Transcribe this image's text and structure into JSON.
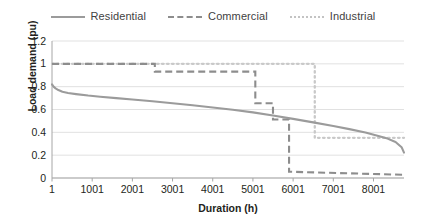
{
  "chart_data": {
    "type": "line",
    "title": "",
    "xlabel": "Duration (h)",
    "ylabel": "Load demand (pu)",
    "xlim": [
      1,
      8760
    ],
    "ylim": [
      0,
      1.2
    ],
    "xticks": [
      1,
      1001,
      2001,
      3001,
      4001,
      5001,
      6001,
      7001,
      8001
    ],
    "xtick_labels": [
      "1",
      "1001",
      "2001",
      "3001",
      "4001",
      "5001",
      "6001",
      "7001",
      "8001"
    ],
    "yticks": [
      0,
      0.2,
      0.4,
      0.6,
      0.8,
      1,
      1.2
    ],
    "ytick_labels": [
      "0",
      "0.2",
      "0.4",
      "0.6",
      "0.8",
      "1",
      "1.2"
    ],
    "grid": true,
    "legend_position": "top-center",
    "series": [
      {
        "name": "Residential",
        "style": "solid",
        "color": "#9b9b9b",
        "x": [
          1,
          40,
          90,
          160,
          260,
          400,
          600,
          900,
          1200,
          1600,
          2001,
          2500,
          3001,
          3500,
          4001,
          4500,
          5001,
          5500,
          6001,
          6500,
          7001,
          7400,
          7800,
          8100,
          8350,
          8550,
          8700,
          8760
        ],
        "y": [
          0.82,
          0.8,
          0.785,
          0.77,
          0.755,
          0.745,
          0.735,
          0.722,
          0.712,
          0.7,
          0.688,
          0.672,
          0.655,
          0.637,
          0.618,
          0.598,
          0.575,
          0.548,
          0.518,
          0.487,
          0.455,
          0.428,
          0.398,
          0.37,
          0.345,
          0.315,
          0.27,
          0.222
        ]
      },
      {
        "name": "Commercial",
        "style": "dashed",
        "color": "#8d8d8d",
        "x": [
          1,
          2560,
          2560,
          5060,
          5060,
          5500,
          5500,
          5900,
          5900,
          8760
        ],
        "y": [
          1.0,
          1.0,
          0.932,
          0.932,
          0.655,
          0.655,
          0.513,
          0.513,
          0.055,
          0.028
        ]
      },
      {
        "name": "Industrial",
        "style": "dotted",
        "color": "#c9c9c9",
        "x": [
          1,
          6540,
          6540,
          8760
        ],
        "y": [
          1.0,
          1.0,
          0.352,
          0.352
        ]
      }
    ]
  },
  "legend": {
    "entries": [
      {
        "label": "Residential",
        "style": "solid"
      },
      {
        "label": "Commercial",
        "style": "dashed"
      },
      {
        "label": "Industrial",
        "style": "dotted"
      }
    ]
  }
}
